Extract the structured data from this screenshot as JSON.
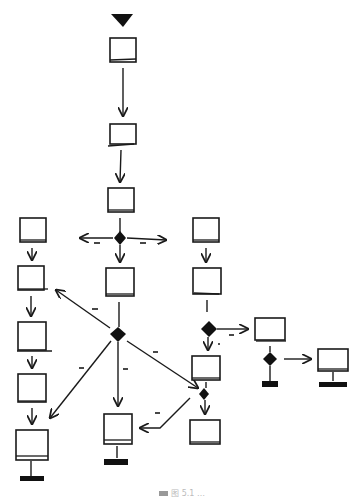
{
  "diagram": {
    "type": "hand-drawn activity/flow diagram",
    "colors": {
      "ink": "#1a1a1a",
      "background": "#ffffff"
    },
    "start": {
      "shape": "filled-triangle",
      "x": 124,
      "y": 14
    },
    "nodes": [
      {
        "id": "n1",
        "shape": "box",
        "x": 110,
        "y": 38,
        "w": 26,
        "h": 24
      },
      {
        "id": "n2",
        "shape": "box",
        "x": 110,
        "y": 124,
        "w": 26,
        "h": 20
      },
      {
        "id": "n3",
        "shape": "box",
        "x": 108,
        "y": 188,
        "w": 26,
        "h": 24
      },
      {
        "id": "l1",
        "shape": "box",
        "x": 20,
        "y": 218,
        "w": 26,
        "h": 24
      },
      {
        "id": "l2",
        "shape": "box",
        "x": 18,
        "y": 266,
        "w": 26,
        "h": 24
      },
      {
        "id": "l3",
        "shape": "box",
        "x": 18,
        "y": 322,
        "w": 28,
        "h": 28
      },
      {
        "id": "l4",
        "shape": "box",
        "x": 18,
        "y": 374,
        "w": 28,
        "h": 28
      },
      {
        "id": "l5",
        "shape": "box",
        "x": 16,
        "y": 430,
        "w": 32,
        "h": 30,
        "terminal": true
      },
      {
        "id": "c1",
        "shape": "box",
        "x": 106,
        "y": 268,
        "w": 28,
        "h": 28
      },
      {
        "id": "c2",
        "shape": "box",
        "x": 104,
        "y": 414,
        "w": 28,
        "h": 30,
        "terminal": true
      },
      {
        "id": "r1",
        "shape": "box",
        "x": 193,
        "y": 218,
        "w": 26,
        "h": 24
      },
      {
        "id": "r2",
        "shape": "box",
        "x": 193,
        "y": 268,
        "w": 28,
        "h": 26
      },
      {
        "id": "r3",
        "shape": "box",
        "x": 192,
        "y": 356,
        "w": 28,
        "h": 24
      },
      {
        "id": "r4",
        "shape": "box",
        "x": 190,
        "y": 420,
        "w": 30,
        "h": 24
      },
      {
        "id": "s1",
        "shape": "box",
        "x": 255,
        "y": 318,
        "w": 30,
        "h": 22,
        "terminal": true
      },
      {
        "id": "s2",
        "shape": "box",
        "x": 318,
        "y": 349,
        "w": 30,
        "h": 22,
        "terminal": true
      }
    ],
    "decisions": [
      {
        "id": "d1",
        "x": 120,
        "y": 238
      },
      {
        "id": "d2",
        "x": 118,
        "y": 334
      },
      {
        "id": "d3",
        "x": 209,
        "y": 329
      },
      {
        "id": "d4",
        "x": 270,
        "y": 359
      },
      {
        "id": "d5",
        "x": 204,
        "y": 394
      }
    ],
    "edges": [
      {
        "from": "start",
        "to": "n1"
      },
      {
        "from": "n1",
        "to": "n2"
      },
      {
        "from": "n2",
        "to": "n3"
      },
      {
        "from": "n3",
        "to": "d1"
      },
      {
        "from": "d1",
        "to": "l1",
        "guard": "-"
      },
      {
        "from": "d1",
        "to": "r1",
        "guard": "-"
      },
      {
        "from": "d1",
        "to": "c1"
      },
      {
        "from": "l1",
        "to": "l2"
      },
      {
        "from": "l2",
        "to": "l3"
      },
      {
        "from": "l3",
        "to": "l4"
      },
      {
        "from": "l4",
        "to": "l5"
      },
      {
        "from": "c1",
        "to": "d2"
      },
      {
        "from": "d2",
        "to": "l2",
        "guard": "-"
      },
      {
        "from": "d2",
        "to": "l5",
        "guard": "-"
      },
      {
        "from": "d2",
        "to": "c2",
        "guard": "-"
      },
      {
        "from": "d2",
        "to": "d5",
        "guard": "-"
      },
      {
        "from": "r1",
        "to": "r2"
      },
      {
        "from": "r2",
        "to": "d3"
      },
      {
        "from": "d3",
        "to": "s1",
        "guard": "-"
      },
      {
        "from": "d3",
        "to": "r3",
        "guard": "-"
      },
      {
        "from": "s1",
        "to": "d4"
      },
      {
        "from": "d4",
        "to": "s2"
      },
      {
        "from": "r3",
        "to": "d5"
      },
      {
        "from": "d5",
        "to": "r4"
      },
      {
        "from": "d5",
        "to": "c2",
        "guard": "-"
      }
    ]
  },
  "caption": {
    "text": "图 5.1  …"
  }
}
